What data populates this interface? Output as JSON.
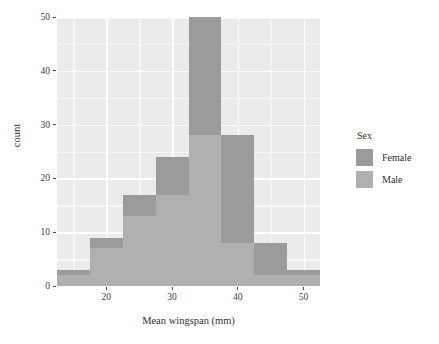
{
  "chart_data": {
    "type": "bar",
    "subtype": "stacked-histogram",
    "title": "",
    "xlabel": "Mean wingspan (mm)",
    "ylabel": "count",
    "xlim": [
      12.5,
      52.5
    ],
    "ylim": [
      0,
      50
    ],
    "binwidth": 5,
    "bin_edges": [
      12.5,
      17.5,
      22.5,
      27.5,
      32.5,
      37.5,
      42.5,
      47.5,
      52.5
    ],
    "bin_centers": [
      15,
      20,
      25,
      30,
      35,
      40,
      45,
      50
    ],
    "categories": [
      "15",
      "20",
      "25",
      "30",
      "35",
      "40",
      "45",
      "50"
    ],
    "values": [
      3,
      9,
      17,
      24,
      50,
      28,
      8,
      3
    ],
    "series": [
      {
        "name": "Female",
        "color": "#9b9b9b",
        "values": [
          1,
          2,
          4,
          7,
          22,
          20,
          6,
          1
        ]
      },
      {
        "name": "Male",
        "color": "#b0b0b0",
        "values": [
          2,
          7,
          13,
          17,
          28,
          8,
          2,
          2
        ]
      }
    ],
    "xticks": [
      20,
      30,
      40,
      50
    ],
    "xtick_labels": [
      "20",
      "30",
      "40",
      "50"
    ],
    "yticks": [
      0,
      10,
      20,
      30,
      40,
      50
    ],
    "ytick_labels": [
      "0",
      "10",
      "20",
      "30",
      "40",
      "50"
    ],
    "grid": true,
    "grid_major_color": "#ffffff",
    "grid_minor_color": "#f7f7f7",
    "panel_background": "#ebebeb",
    "legend_position": "right"
  },
  "legend": {
    "title": "Sex",
    "entries": [
      {
        "label": "Female",
        "color": "#9b9b9b"
      },
      {
        "label": "Male",
        "color": "#b0b0b0"
      }
    ]
  },
  "axes": {
    "x_label": "Mean wingspan (mm)",
    "y_label": "count"
  }
}
